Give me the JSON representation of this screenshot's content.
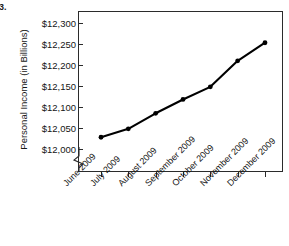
{
  "figure": {
    "label": "3."
  },
  "chart_data": {
    "type": "line",
    "title": "",
    "xlabel": "",
    "ylabel": "Personal Income (in Billions)",
    "categories": [
      "June 2009",
      "July 2009",
      "August 2009",
      "September 2009",
      "October 2009",
      "November 2009",
      "December 2009"
    ],
    "values": [
      12028,
      12048,
      12085,
      12118,
      12148,
      12210,
      12253
    ],
    "series": [
      {
        "name": "Personal Income",
        "values": [
          12028,
          12048,
          12085,
          12118,
          12148,
          12210,
          12253
        ]
      }
    ],
    "ylim": [
      12000,
      12300
    ],
    "ytick_values": [
      12000,
      12050,
      12100,
      12150,
      12200,
      12250,
      12300
    ],
    "ytick_labels": [
      "$12,000",
      "$12,050",
      "$12,100",
      "$12,150",
      "$12,200",
      "$12,250",
      "$12,300"
    ],
    "grid": false,
    "legend": "none",
    "axis_break": true,
    "marker": "filled-circle",
    "line_color": "#000000",
    "marker_color": "#000000"
  }
}
